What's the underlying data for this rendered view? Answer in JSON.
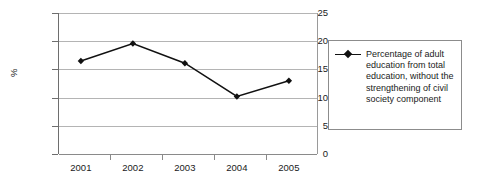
{
  "chart_data": {
    "type": "line",
    "title": "",
    "xlabel": "",
    "ylabel": "%",
    "categories": [
      "2001",
      "2002",
      "2003",
      "2004",
      "2005"
    ],
    "series": [
      {
        "name": "Percentage of adult education from total education, without the strengthening of civil society component",
        "values": [
          16.5,
          19.6,
          16.1,
          10.2,
          13.0
        ]
      }
    ],
    "ylim": [
      0,
      25
    ],
    "yticks": [
      0,
      5,
      10,
      15,
      20,
      25
    ],
    "ytick_labels": [
      "0",
      "5",
      "10",
      "15",
      "20",
      "25"
    ],
    "grid": true,
    "legend_position": "right",
    "marker": "diamond",
    "line_color": "#111111",
    "marker_color": "#111111",
    "grid_color": "#b4b4b4",
    "axis_color": "#6e6e6e"
  },
  "legend": {
    "entries": [
      {
        "label": "Percentage of adult education from total education, without the strengthening of civil society component",
        "marker": "line-with-diamond-marker",
        "color": "#111111"
      }
    ]
  }
}
